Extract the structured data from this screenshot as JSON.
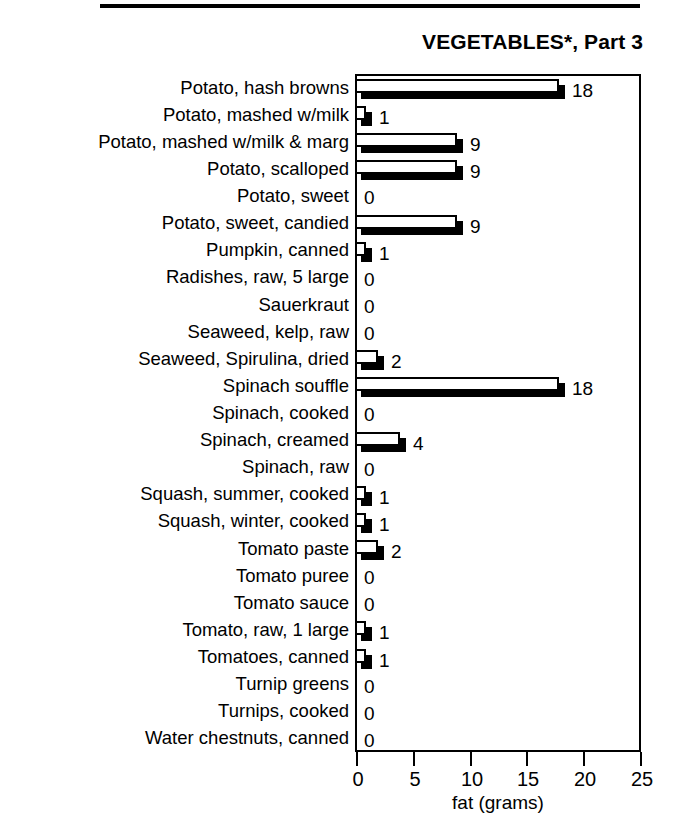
{
  "chart_data": {
    "type": "bar",
    "orientation": "horizontal",
    "title": "VEGETABLES*, Part 3",
    "xlabel": "fat (grams)",
    "ylabel": "",
    "xlim": [
      0,
      25
    ],
    "xticks": [
      0,
      5,
      10,
      15,
      20,
      25
    ],
    "xtick_labels": [
      "0",
      "5",
      "10",
      "15",
      "20",
      "25"
    ],
    "grid": false,
    "legend": null,
    "bar_style": {
      "face_color": "#ffffff",
      "edge_color": "#000000",
      "shadow_color": "#000000",
      "shadow_offset_px": 6
    },
    "categories": [
      "Potato, hash browns",
      "Potato, mashed w/milk",
      "Potato, mashed w/milk & marg",
      "Potato, scalloped",
      "Potato, sweet",
      "Potato, sweet, candied",
      "Pumpkin, canned",
      "Radishes, raw, 5 large",
      "Sauerkraut",
      "Seaweed, kelp, raw",
      "Seaweed, Spirulina, dried",
      "Spinach souffle",
      "Spinach, cooked",
      "Spinach, creamed",
      "Spinach, raw",
      "Squash, summer, cooked",
      "Squash, winter, cooked",
      "Tomato paste",
      "Tomato puree",
      "Tomato sauce",
      "Tomato, raw, 1 large",
      "Tomatoes, canned",
      "Turnip greens",
      "Turnips, cooked",
      "Water chestnuts, canned"
    ],
    "values": [
      18,
      1,
      9,
      9,
      0,
      9,
      1,
      0,
      0,
      0,
      2,
      18,
      0,
      4,
      0,
      1,
      1,
      2,
      0,
      0,
      1,
      1,
      0,
      0,
      0
    ],
    "value_labels": [
      "18",
      "1",
      "9",
      "9",
      "0",
      "9",
      "1",
      "0",
      "0",
      "0",
      "2",
      "18",
      "0",
      "4",
      "0",
      "1",
      "1",
      "2",
      "0",
      "0",
      "1",
      "1",
      "0",
      "0",
      "0"
    ]
  },
  "decor": {
    "top_rule": ""
  }
}
